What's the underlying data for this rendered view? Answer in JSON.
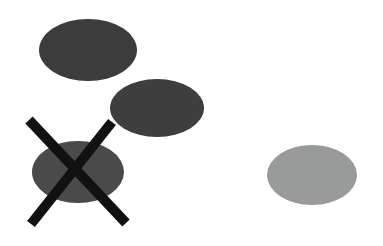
{
  "figure": {
    "title": "Four gray ellipses on a white background with one crossed out",
    "width": 383,
    "height": 246,
    "background_color": "#ffffff",
    "caption": ""
  },
  "shapes": [
    {
      "id": "ellipse-top-left",
      "role": "ellipse",
      "label": "",
      "fill": "#3c3c3c",
      "cx": 88,
      "cy": 50,
      "rx": 49,
      "ry": 31,
      "crossed_out": false
    },
    {
      "id": "ellipse-middle",
      "role": "ellipse",
      "label": "",
      "fill": "#3e3e3e",
      "cx": 157,
      "cy": 108,
      "rx": 47,
      "ry": 29,
      "crossed_out": false
    },
    {
      "id": "ellipse-bottom-left",
      "role": "ellipse",
      "label": "",
      "fill": "#4a4a4a",
      "cx": 78,
      "cy": 172,
      "rx": 46,
      "ry": 31,
      "crossed_out": true
    },
    {
      "id": "ellipse-right",
      "role": "ellipse",
      "label": "",
      "fill": "#999a9a",
      "cx": 312,
      "cy": 175,
      "rx": 45,
      "ry": 30,
      "crossed_out": false
    }
  ],
  "cross_mark": {
    "id": "cross-out-mark",
    "label": "",
    "color": "#111111",
    "stroke_width": 10,
    "stroke_one": {
      "x1": 29,
      "y1": 120,
      "x2": 126,
      "y2": 223
    },
    "stroke_two": {
      "x1": 112,
      "y1": 122,
      "x2": 31,
      "y2": 224
    }
  }
}
